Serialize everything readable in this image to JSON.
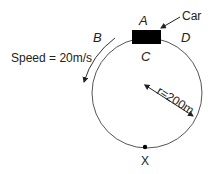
{
  "diagram": {
    "labels": {
      "car": "Car",
      "point_a": "A",
      "point_b": "B",
      "point_c": "C",
      "point_d": "D",
      "point_x": "X",
      "speed": "Speed = 20m/s",
      "radius": "r=200m"
    },
    "values": {
      "speed_mps": 20,
      "radius_m": 200
    },
    "colors": {
      "stroke": "#444444",
      "car_fill": "#000000",
      "text": "#222222"
    }
  }
}
